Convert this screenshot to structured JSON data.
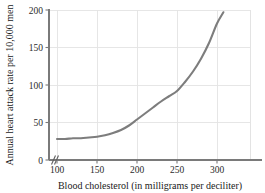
{
  "chart_data": {
    "type": "line",
    "title": "",
    "subtitle": "",
    "xlabel": "Blood cholesterol (in milligrams per deciliter)",
    "ylabel": "Annual heart attack rate per 10,000 men",
    "xlim": [
      100,
      340
    ],
    "ylim": [
      0,
      200
    ],
    "xticks": [
      100,
      150,
      200,
      250,
      300
    ],
    "xtick_labels": [
      "100",
      "150",
      "200",
      "250",
      "300"
    ],
    "yticks": [
      0,
      50,
      100,
      150,
      200
    ],
    "ytick_labels": [
      "0",
      "50",
      "100",
      "150",
      "200"
    ],
    "grid": true,
    "legend": false,
    "legend_position": "none",
    "axis_break": "//",
    "axis_break_axis": "x",
    "curve_color": "#7d7d7d",
    "grid_color": "#e3e3e3",
    "axis_color": "#7a7a7a",
    "series": [
      {
        "name": "Annual heart attack rate",
        "x": [
          100,
          110,
          120,
          130,
          140,
          150,
          160,
          170,
          180,
          190,
          200,
          210,
          220,
          230,
          240,
          250,
          260,
          270,
          280,
          290,
          300,
          308
        ],
        "values": [
          28,
          28,
          29,
          29,
          30,
          31,
          33,
          36,
          40,
          46,
          54,
          62,
          70,
          78,
          85,
          92,
          104,
          118,
          135,
          156,
          182,
          197
        ]
      }
    ]
  },
  "axis": {
    "x_title": "Blood cholesterol (in milligrams per deciliter)",
    "y_title": "Annual heart attack rate per 10,000 men",
    "x_tick_labels": [
      "100",
      "150",
      "200",
      "250",
      "300"
    ],
    "y_tick_labels": [
      "0",
      "50",
      "100",
      "150",
      "200"
    ],
    "break_symbol": "//"
  }
}
